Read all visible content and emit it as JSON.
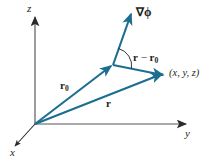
{
  "figure": {
    "background_color": "#ffffff",
    "vector_color": "#1c6e91",
    "axis_color": "#8c8c8c",
    "text_color": "#231f20"
  },
  "axes": {
    "z": {
      "label": "z",
      "icon": "axis-arrow-up"
    },
    "y": {
      "label": "y",
      "icon": "axis-arrow-right"
    },
    "x": {
      "label": "x",
      "icon": "axis-arrow-down-left"
    }
  },
  "vectors": {
    "r0": {
      "label_html": "<b>r</b><sub>0</sub>",
      "plain": "r0"
    },
    "r": {
      "label_html": "<b>r</b>",
      "plain": "r"
    },
    "r_minus_r0": {
      "label_html": "<b>r</b> &#8722; <b>r</b><sub>0</sub>",
      "plain": "r - r0"
    },
    "gradient": {
      "label_html": "&#8711;&#981;",
      "plain": "grad phi"
    }
  },
  "points": {
    "field_point": {
      "label": "(x, y, z)"
    },
    "origin": {
      "label": "O"
    }
  },
  "annotations": {
    "angle_arc": {
      "name": "angle-between-gradient-and-displacement"
    }
  }
}
